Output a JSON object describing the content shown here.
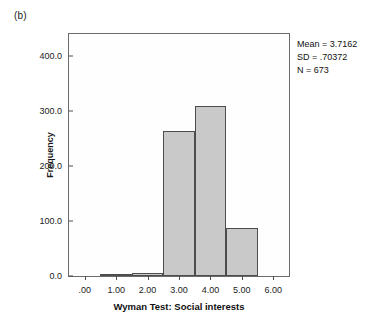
{
  "figure": {
    "panel_label": "(b)"
  },
  "annotations": {
    "mean": "Mean = 3.7162",
    "sd": "SD = .70372",
    "n": "N = 673"
  },
  "chart_data": {
    "type": "bar",
    "title": "",
    "subtitle": "",
    "xlabel": "Wyman Test: Social interests",
    "ylabel": "Frequency",
    "categories": [
      ".00",
      "1.00",
      "2.00",
      "3.00",
      "4.00",
      "5.00",
      "6.00"
    ],
    "x": [
      0,
      1,
      2,
      3,
      4,
      5,
      6
    ],
    "values": [
      0,
      1,
      5,
      263,
      310,
      87,
      0
    ],
    "bin_width": 1.0,
    "xlim": [
      -0.5,
      6.5
    ],
    "ylim": [
      0,
      440
    ],
    "ytick_labels": [
      "0.0",
      "100.0",
      "200.0",
      "300.0",
      "400.0"
    ],
    "ytick_values": [
      0,
      100,
      200,
      300,
      400
    ],
    "xtick_labels": [
      ".00",
      "1.00",
      "2.00",
      "3.00",
      "4.00",
      "5.00",
      "6.00"
    ],
    "xtick_values": [
      0,
      1,
      2,
      3,
      4,
      5,
      6
    ],
    "grid": false,
    "legend": "none",
    "bar_fill_color": "#c9c9c9",
    "bar_edge_color": "#4d4d4d",
    "plot_background": "#fefefe",
    "frame_color": "#6b6b6b",
    "statistics": {
      "mean": 3.7162,
      "sd": 0.70372,
      "n": 673
    }
  }
}
